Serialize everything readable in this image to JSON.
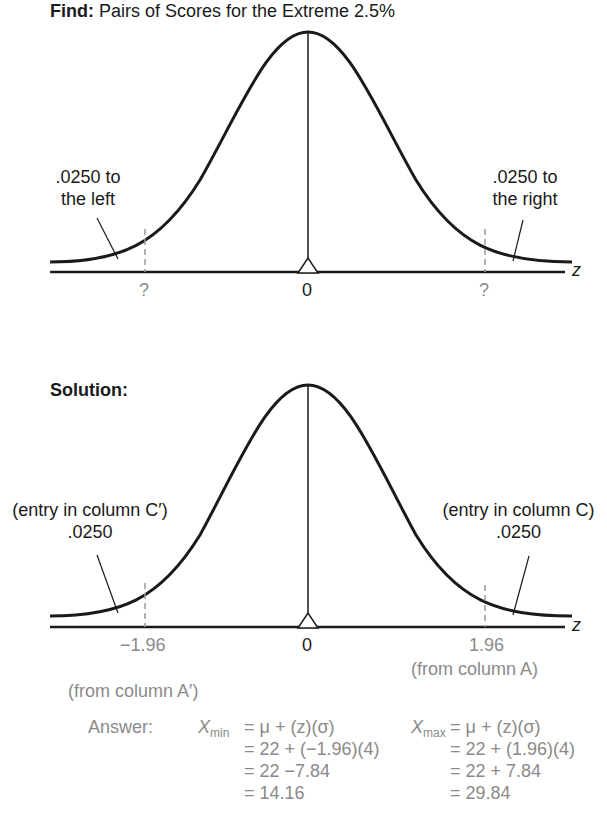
{
  "find": {
    "heading_bold": "Find:",
    "heading_rest": " Pairs of Scores for the Extreme 2.5%",
    "left_label_line1": ".0250  to",
    "left_label_line2": "the left",
    "right_label_line1": ".0250 to",
    "right_label_line2": "the right",
    "left_tick": "?",
    "center_tick": "0",
    "right_tick": "?",
    "axis_label": "z"
  },
  "solution": {
    "heading": "Solution:",
    "left_label_line1": "(entry in column C′)",
    "left_label_line2": ".0250",
    "right_label_line1": "(entry in column C)",
    "right_label_line2": ".0250",
    "left_tick": "−1.96",
    "left_tick_note": "(from column A′)",
    "center_tick": "0",
    "right_tick": "1.96",
    "right_tick_note": "(from column A)",
    "axis_label": "z"
  },
  "answer": {
    "label": "Answer:",
    "min": {
      "var": "X",
      "sub": "min",
      "lines": [
        "= μ + (z)(σ)",
        "= 22 + (−1.96)(4)",
        "= 22 −7.84",
        "= 14.16"
      ]
    },
    "max": {
      "var": "X",
      "sub": "max",
      "lines": [
        "= μ + (z)(σ)",
        "= 22 + (1.96)(4)",
        "= 22 + 7.84",
        "= 29.84"
      ]
    }
  },
  "colors": {
    "ink": "#1a1a1a",
    "gray": "#8a8a8a",
    "dash": "#9a9a9a"
  }
}
